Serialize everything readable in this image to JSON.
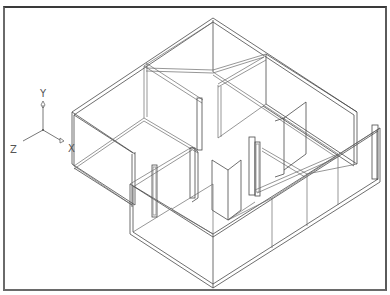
{
  "drawing": {
    "type": "isometric-wireframe-floor-plan",
    "view": "3D isometric (SE)"
  },
  "ucs_icon": {
    "axes": [
      {
        "label": "Y",
        "direction": "up"
      },
      {
        "label": "X",
        "direction": "down-right"
      },
      {
        "label": "Z",
        "direction": "down-left"
      }
    ]
  },
  "colors": {
    "background": "#ffffff",
    "line": "#4a4a4a",
    "frame": "#3a3a3a"
  }
}
